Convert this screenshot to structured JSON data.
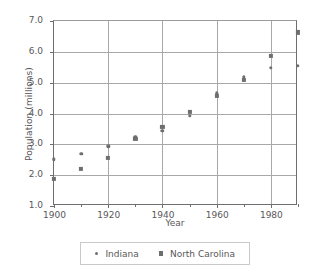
{
  "chart_data": {
    "type": "scatter",
    "title": "",
    "xlabel": "Year",
    "ylabel": "Population (millions)",
    "xlim": [
      1900,
      1990
    ],
    "ylim": [
      1.0,
      7.0
    ],
    "grid": true,
    "legend_position": "bottom",
    "x_ticks_major": [
      1900,
      1920,
      1940,
      1960,
      1980
    ],
    "x_ticks_minor": [
      1910,
      1930,
      1950,
      1970,
      1990
    ],
    "x_tick_labels": [
      "1900",
      "1920",
      "1940",
      "1960",
      "1980"
    ],
    "y_ticks": [
      1.0,
      2.0,
      3.0,
      4.0,
      5.0,
      6.0,
      7.0
    ],
    "y_tick_labels": [
      "1.0",
      "2.0",
      "3.0",
      "4.0",
      "5.0",
      "6.0",
      "7.0"
    ],
    "x": [
      1900,
      1910,
      1920,
      1930,
      1940,
      1950,
      1960,
      1970,
      1980,
      1990
    ],
    "series": [
      {
        "name": "Indiana",
        "marker": "circle",
        "color": "#6d6e70",
        "values": [
          2.52,
          2.7,
          2.93,
          3.24,
          3.43,
          3.93,
          4.66,
          5.19,
          5.49,
          5.54
        ]
      },
      {
        "name": "North Carolina",
        "marker": "square",
        "color": "#6d6e70",
        "values": [
          1.89,
          2.21,
          2.56,
          3.17,
          3.57,
          4.06,
          4.56,
          5.08,
          5.88,
          6.63
        ]
      }
    ]
  },
  "legend": {
    "items": [
      {
        "label": "Indiana",
        "marker": "circle"
      },
      {
        "label": "North Carolina",
        "marker": "square"
      }
    ]
  },
  "axes": {
    "x_title": "Year",
    "y_title": "Population (millions)"
  }
}
